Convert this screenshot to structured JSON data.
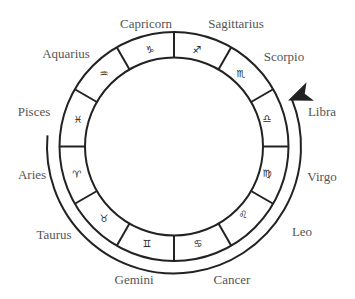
{
  "diagram": {
    "signs": [
      {
        "name": "Capricorn",
        "symbol": "♑",
        "label_x": 146,
        "label_y": 24,
        "sym_x": 150,
        "sym_y": 50
      },
      {
        "name": "Sagittarius",
        "symbol": "♐",
        "label_x": 236,
        "label_y": 24,
        "sym_x": 197,
        "sym_y": 50
      },
      {
        "name": "Scorpio",
        "symbol": "♏",
        "label_x": 284,
        "label_y": 57,
        "sym_x": 241,
        "sym_y": 74
      },
      {
        "name": "Libra",
        "symbol": "♎",
        "label_x": 322,
        "label_y": 112,
        "sym_x": 267,
        "sym_y": 119
      },
      {
        "name": "Virgo",
        "symbol": "♍",
        "label_x": 322,
        "label_y": 177,
        "sym_x": 267,
        "sym_y": 174
      },
      {
        "name": "Leo",
        "symbol": "♌",
        "label_x": 302,
        "label_y": 232,
        "sym_x": 243,
        "sym_y": 215
      },
      {
        "name": "Cancer",
        "symbol": "♋",
        "label_x": 232,
        "label_y": 280,
        "sym_x": 198,
        "sym_y": 244
      },
      {
        "name": "Gemini",
        "symbol": "♊",
        "label_x": 134,
        "label_y": 280,
        "sym_x": 147,
        "sym_y": 244
      },
      {
        "name": "Taurus",
        "symbol": "♉",
        "label_x": 54,
        "label_y": 235,
        "sym_x": 104,
        "sym_y": 219
      },
      {
        "name": "Aries",
        "symbol": "♈",
        "label_x": 32,
        "label_y": 175,
        "sym_x": 77,
        "sym_y": 175
      },
      {
        "name": "Pisces",
        "symbol": "♓",
        "label_x": 34,
        "label_y": 112,
        "sym_x": 78,
        "sym_y": 120
      },
      {
        "name": "Aquarius",
        "symbol": "♒",
        "label_x": 66,
        "label_y": 54,
        "sym_x": 104,
        "sym_y": 74
      }
    ],
    "colors": {
      "stroke": "#222222",
      "label": "#555555"
    }
  }
}
